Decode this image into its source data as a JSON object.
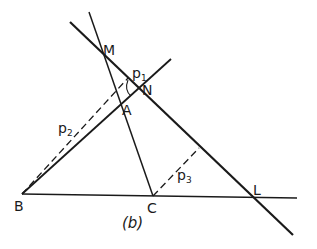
{
  "figure": {
    "caption": "(b)",
    "points": {
      "M": {
        "label": "M",
        "x": 105,
        "y": 56
      },
      "N": {
        "label": "N",
        "x": 137,
        "y": 93
      },
      "A": {
        "label": "A",
        "x": 124,
        "y": 101
      },
      "B": {
        "label": "B",
        "x": 22,
        "y": 194
      },
      "C": {
        "label": "C",
        "x": 153,
        "y": 196
      },
      "L": {
        "label": "L",
        "x": 252,
        "y": 197
      }
    },
    "distances": {
      "p1": {
        "base": "p",
        "sub": "1"
      },
      "p2": {
        "base": "p",
        "sub": "2"
      },
      "p3": {
        "base": "p",
        "sub": "3"
      }
    },
    "lines": [
      {
        "name": "line-MNL",
        "from": [
          70,
          22
        ],
        "to": [
          293,
          235
        ],
        "style": "solid",
        "weight": "bold"
      },
      {
        "name": "line-CA-extended",
        "from": [
          89,
          12
        ],
        "to": [
          153,
          196
        ],
        "style": "solid"
      },
      {
        "name": "line-BA-extended",
        "from": [
          22,
          194
        ],
        "to": [
          171,
          59
        ],
        "style": "solid"
      },
      {
        "name": "line-BL",
        "from": [
          22,
          194
        ],
        "to": [
          297,
          198
        ],
        "style": "solid"
      },
      {
        "name": "perp-p2",
        "from": [
          22,
          194
        ],
        "to": [
          128,
          78
        ],
        "style": "dashed"
      },
      {
        "name": "perp-p3",
        "from": [
          153,
          196
        ],
        "to": [
          199,
          148
        ],
        "style": "dashed"
      },
      {
        "name": "perp-p1",
        "from": [
          121,
          78
        ],
        "to": [
          124,
          101
        ],
        "style": "solid-thin"
      }
    ]
  }
}
